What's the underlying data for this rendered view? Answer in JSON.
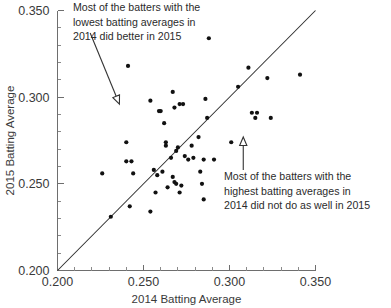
{
  "chart_data": {
    "type": "scatter",
    "title": "",
    "xlabel": "2014 Batting Average",
    "ylabel": "2015 Batting Average",
    "xlim": [
      0.2,
      0.35
    ],
    "ylim": [
      0.2,
      0.35
    ],
    "xticks": [
      "0.200",
      "0.250",
      "0.300",
      "0.350"
    ],
    "xtick_values": [
      0.2,
      0.25,
      0.3,
      0.35
    ],
    "yticks": [
      "0.200",
      "0.250",
      "0.300",
      "0.350"
    ],
    "ytick_values": [
      0.2,
      0.25,
      0.3,
      0.35
    ],
    "minor_tick_step": 0.01,
    "grid": false,
    "legend": null,
    "reference_line": {
      "name": "y = x identity line",
      "from": [
        0.2,
        0.2
      ],
      "to": [
        0.35,
        0.35
      ]
    },
    "point_color": "#111111",
    "series": [
      {
        "name": "Batters",
        "points": [
          [
            0.226,
            0.256
          ],
          [
            0.231,
            0.231
          ],
          [
            0.24,
            0.274
          ],
          [
            0.24,
            0.263
          ],
          [
            0.241,
            0.318
          ],
          [
            0.242,
            0.237
          ],
          [
            0.243,
            0.263
          ],
          [
            0.244,
            0.256
          ],
          [
            0.254,
            0.298
          ],
          [
            0.254,
            0.234
          ],
          [
            0.256,
            0.258
          ],
          [
            0.257,
            0.245
          ],
          [
            0.258,
            0.255
          ],
          [
            0.259,
            0.292
          ],
          [
            0.26,
            0.292
          ],
          [
            0.261,
            0.257
          ],
          [
            0.262,
            0.285
          ],
          [
            0.263,
            0.274
          ],
          [
            0.263,
            0.272
          ],
          [
            0.264,
            0.248
          ],
          [
            0.266,
            0.265
          ],
          [
            0.267,
            0.303
          ],
          [
            0.267,
            0.254
          ],
          [
            0.268,
            0.294
          ],
          [
            0.268,
            0.251
          ],
          [
            0.269,
            0.25
          ],
          [
            0.269,
            0.269
          ],
          [
            0.27,
            0.271
          ],
          [
            0.271,
            0.296
          ],
          [
            0.271,
            0.245
          ],
          [
            0.272,
            0.249
          ],
          [
            0.273,
            0.296
          ],
          [
            0.274,
            0.266
          ],
          [
            0.276,
            0.264
          ],
          [
            0.278,
            0.272
          ],
          [
            0.279,
            0.265
          ],
          [
            0.282,
            0.277
          ],
          [
            0.283,
            0.257
          ],
          [
            0.284,
            0.25
          ],
          [
            0.285,
            0.264
          ],
          [
            0.285,
            0.241
          ],
          [
            0.286,
            0.299
          ],
          [
            0.287,
            0.288
          ],
          [
            0.288,
            0.334
          ],
          [
            0.291,
            0.264
          ],
          [
            0.301,
            0.274
          ],
          [
            0.305,
            0.306
          ],
          [
            0.311,
            0.317
          ],
          [
            0.313,
            0.291
          ],
          [
            0.315,
            0.288
          ],
          [
            0.316,
            0.291
          ],
          [
            0.322,
            0.311
          ],
          [
            0.324,
            0.288
          ],
          [
            0.341,
            0.313
          ]
        ]
      }
    ],
    "annotations": [
      {
        "id": "low-average-note",
        "lines": [
          "Most of the batters with the",
          "lowest batting averages in",
          "2014 did better in 2015"
        ],
        "arrow": {
          "type": "diagonal-down-right",
          "tail": [
            0.219,
            0.337
          ],
          "head": [
            0.236,
            0.296
          ]
        }
      },
      {
        "id": "high-average-note",
        "lines": [
          "Most of the batters with the",
          "highest batting averages in",
          "2014 did not do as well in 2015"
        ],
        "arrow": {
          "type": "vertical-up",
          "tail": [
            0.308,
            0.258
          ],
          "head": [
            0.308,
            0.277
          ]
        }
      }
    ]
  }
}
